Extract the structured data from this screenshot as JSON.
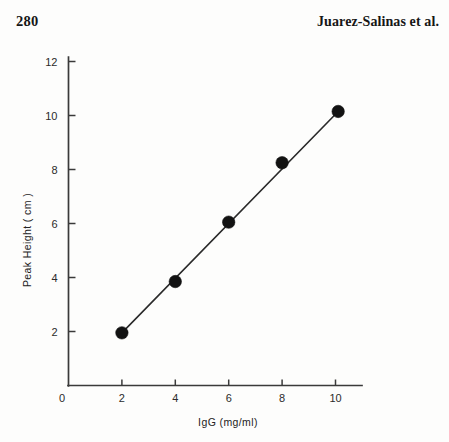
{
  "header": {
    "page_number": "280",
    "running_head": "Juarez-Salinas et al."
  },
  "chart_data": {
    "type": "scatter",
    "title": "",
    "xlabel": "IgG (mg/ml)",
    "ylabel": "Peak Height ( cm )",
    "xlim": [
      0,
      11.4
    ],
    "ylim": [
      0,
      12.6
    ],
    "xticks": [
      2,
      4,
      6,
      8,
      10
    ],
    "xtick_labels": [
      "2",
      "4",
      "6",
      "8",
      "10"
    ],
    "yticks": [
      2,
      4,
      6,
      8,
      10,
      12
    ],
    "ytick_labels": [
      "2",
      "4",
      "6",
      "8",
      "10",
      "12"
    ],
    "origin_label": "0",
    "grid": false,
    "legend": "none",
    "marker": "filled-circle",
    "marker_color": "#121212",
    "line_color": "#2a2a2a",
    "x": [
      2.0,
      4.0,
      6.0,
      8.0,
      10.1
    ],
    "y": [
      1.95,
      3.85,
      6.05,
      8.25,
      10.15
    ],
    "points": [
      {
        "x": 2.0,
        "y": 1.95
      },
      {
        "x": 4.0,
        "y": 3.85
      },
      {
        "x": 6.0,
        "y": 6.05
      },
      {
        "x": 8.0,
        "y": 8.25
      },
      {
        "x": 10.1,
        "y": 10.15
      }
    ],
    "fit_line": {
      "from": {
        "x": 2.0,
        "y": 1.95
      },
      "to": {
        "x": 10.1,
        "y": 10.15
      }
    }
  }
}
